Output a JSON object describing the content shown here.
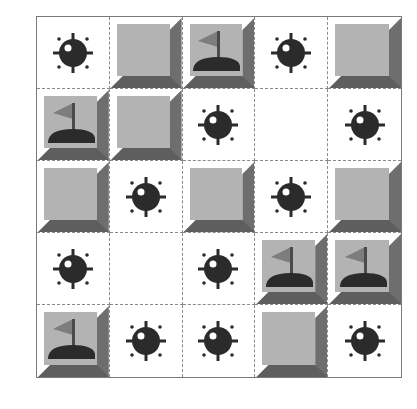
{
  "board": {
    "rows": 5,
    "cols": 5,
    "colors": {
      "tile_face": "#b3b3b3",
      "tile_shadow": "#5e5e5e",
      "mine": "#2b2b2b",
      "flag": "#7d7d7d",
      "grid_line": "#8a8a8a"
    },
    "cells": [
      [
        "mine",
        "covered",
        "flag",
        "mine",
        "covered"
      ],
      [
        "flag",
        "covered",
        "mine",
        "empty",
        "mine"
      ],
      [
        "covered",
        "mine",
        "covered",
        "mine",
        "covered"
      ],
      [
        "mine",
        "empty",
        "mine",
        "flag",
        "flag"
      ],
      [
        "flag",
        "mine",
        "mine",
        "covered",
        "mine"
      ]
    ]
  },
  "icons": {
    "mine": "mine-icon",
    "flag": "flag-icon"
  }
}
